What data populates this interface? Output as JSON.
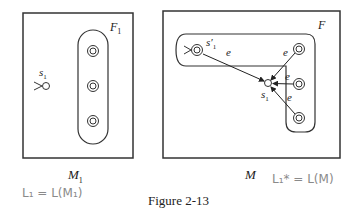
{
  "figure": {
    "caption": "Figure 2-13",
    "left_machine": {
      "name": "M",
      "name_sub": "1",
      "accept_set_label": "F",
      "accept_set_sub": "1",
      "start_state": "s",
      "start_state_sub": "1",
      "handwritten_note": "L₁ = L(M₁)"
    },
    "right_machine": {
      "name": "M",
      "accept_set_label": "F",
      "new_start_state": "s′",
      "new_start_state_sub": "1",
      "old_start_state": "s",
      "old_start_state_sub": "1",
      "edge_label": "e",
      "handwritten_note": "L₁* = L(M)"
    }
  }
}
